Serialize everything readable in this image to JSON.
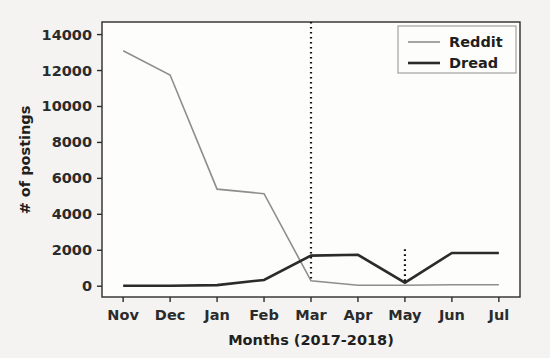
{
  "chart_data": {
    "type": "line",
    "title": "",
    "xlabel": "Months (2017-2018)",
    "ylabel": "# of postings",
    "categories": [
      "Nov",
      "Dec",
      "Jan",
      "Feb",
      "Mar",
      "Apr",
      "May",
      "Jun",
      "Jul"
    ],
    "xtick_labels": [
      "Nov",
      "Dec",
      "Jan",
      "Feb",
      "Mar",
      "Apr",
      "May",
      "Jun",
      "Jul"
    ],
    "ytick_labels": [
      "0",
      "2000",
      "4000",
      "6000",
      "8000",
      "10000",
      "12000",
      "14000"
    ],
    "ytick_values": [
      0,
      2000,
      4000,
      6000,
      8000,
      10000,
      12000,
      14000
    ],
    "ylim": [
      -600,
      14700
    ],
    "xlim": [
      -0.45,
      8.45
    ],
    "grid": false,
    "legend_position": "upper right",
    "series": [
      {
        "name": "Reddit",
        "color": "#8e8e8e",
        "linewidth": 1.6,
        "values": [
          13100,
          11750,
          5400,
          5150,
          300,
          50,
          50,
          80,
          80
        ]
      },
      {
        "name": "Dread",
        "color": "#2b2b2b",
        "linewidth": 2.6,
        "values": [
          30,
          30,
          60,
          350,
          1700,
          1750,
          200,
          1850,
          1850
        ]
      }
    ],
    "annotations": [
      {
        "name": "vline-mar",
        "type": "vline",
        "x_category": "Mar",
        "style": "dotted",
        "color": "#111111",
        "y_from": 14700,
        "y_to": 300
      },
      {
        "name": "vline-may",
        "type": "vline",
        "x_category": "May",
        "style": "dotted",
        "color": "#111111",
        "y_from": 2050,
        "y_to": 200
      }
    ]
  },
  "legend": {
    "entries": [
      {
        "label": "Reddit"
      },
      {
        "label": "Dread"
      }
    ]
  },
  "axes": {
    "ylabel": "# of postings",
    "xlabel": "Months (2017-2018)",
    "y_ticks": [
      {
        "label": "14000"
      },
      {
        "label": "12000"
      },
      {
        "label": "10000"
      },
      {
        "label": "8000"
      },
      {
        "label": "6000"
      },
      {
        "label": "4000"
      },
      {
        "label": "2000"
      },
      {
        "label": "0"
      }
    ],
    "x_ticks": [
      {
        "label": "Nov"
      },
      {
        "label": "Dec"
      },
      {
        "label": "Jan"
      },
      {
        "label": "Feb"
      },
      {
        "label": "Mar"
      },
      {
        "label": "Apr"
      },
      {
        "label": "May"
      },
      {
        "label": "Jun"
      },
      {
        "label": "Jul"
      }
    ]
  },
  "colors": {
    "background": "#f4f3f1",
    "axis": "#2b2b2b",
    "reddit": "#8e8e8e",
    "dread": "#2b2b2b"
  }
}
